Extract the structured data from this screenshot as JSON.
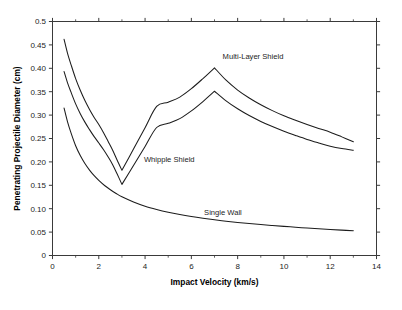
{
  "chart_data": {
    "type": "line",
    "title": "",
    "subtitle": "",
    "xlabel": "Impact Velocity (km/s)",
    "ylabel": "Penetrating Projectile Diameter (cm)",
    "xlim": [
      0,
      14
    ],
    "ylim": [
      0,
      0.5
    ],
    "grid": false,
    "legend_position": "inline-annotations",
    "x_ticks": [
      0,
      2,
      4,
      6,
      8,
      10,
      12,
      14
    ],
    "x_tick_labels": [
      "0",
      "2",
      "4",
      "6",
      "8",
      "10",
      "12",
      "14"
    ],
    "x_minor_ticks": [
      1,
      3,
      5,
      7,
      9,
      11,
      13
    ],
    "y_ticks": [
      0,
      0.05,
      0.1,
      0.15,
      0.2,
      0.25,
      0.3,
      0.35,
      0.4,
      0.45,
      0.5
    ],
    "y_tick_labels": [
      "0",
      "0.05",
      "0.10",
      "0.15",
      "0.20",
      "0.25",
      "0.30",
      "0.35",
      "0.40",
      "0.45",
      "0.5"
    ],
    "series": [
      {
        "name": "Multi-Layer Shield",
        "color": "#1c1c1c",
        "label_x": 7.35,
        "label_y": 0.425,
        "x": [
          0.5,
          0.65,
          0.8,
          1.0,
          1.2,
          1.4,
          1.6,
          1.8,
          2.0,
          2.2,
          2.4,
          2.6,
          2.8,
          3.0,
          3.5,
          4.0,
          4.5,
          5.0,
          5.5,
          6.0,
          6.5,
          7.0,
          7.5,
          8.0,
          8.5,
          9.0,
          9.5,
          10.0,
          10.5,
          11.0,
          11.5,
          12.0,
          12.5,
          13.0
        ],
        "y": [
          0.462,
          0.432,
          0.408,
          0.378,
          0.353,
          0.331,
          0.312,
          0.295,
          0.28,
          0.263,
          0.244,
          0.225,
          0.203,
          0.182,
          0.2275,
          0.273,
          0.3185,
          0.3275,
          0.3385,
          0.3565,
          0.378,
          0.401,
          0.3745,
          0.3535,
          0.3365,
          0.322,
          0.3095,
          0.2985,
          0.289,
          0.28,
          0.2715,
          0.2635,
          0.2535,
          0.243
        ]
      },
      {
        "name": "Whipple Shield",
        "color": "#1c1c1c",
        "label_x": 3.95,
        "label_y": 0.205,
        "x": [
          0.5,
          0.65,
          0.8,
          1.0,
          1.2,
          1.4,
          1.6,
          1.8,
          2.0,
          2.2,
          2.4,
          2.6,
          2.8,
          3.0,
          3.5,
          4.0,
          4.5,
          5.0,
          5.5,
          6.0,
          6.5,
          7.0,
          7.5,
          8.0,
          8.5,
          9.0,
          9.5,
          10.0,
          10.5,
          11.0,
          11.5,
          12.0,
          12.5,
          13.0
        ],
        "y": [
          0.393,
          0.369,
          0.349,
          0.324,
          0.303,
          0.285,
          0.269,
          0.254,
          0.2405,
          0.2265,
          0.211,
          0.194,
          0.1735,
          0.152,
          0.1925,
          0.233,
          0.2735,
          0.2825,
          0.2925,
          0.309,
          0.329,
          0.351,
          0.3305,
          0.3135,
          0.299,
          0.2865,
          0.2755,
          0.2655,
          0.2565,
          0.248,
          0.2405,
          0.2335,
          0.2285,
          0.225
        ]
      },
      {
        "name": "Single Wall",
        "color": "#1c1c1c",
        "label_x": 6.55,
        "label_y": 0.0915,
        "x": [
          0.5,
          0.65,
          0.8,
          1.0,
          1.2,
          1.4,
          1.6,
          1.8,
          2.0,
          2.25,
          2.5,
          2.75,
          3.0,
          3.5,
          4.0,
          4.5,
          5.0,
          5.5,
          6.0,
          6.5,
          7.0,
          7.5,
          8.0,
          8.5,
          9.0,
          9.5,
          10.0,
          10.5,
          11.0,
          11.5,
          12.0,
          12.5,
          13.0
        ],
        "y": [
          0.315,
          0.2855,
          0.262,
          0.2345,
          0.2135,
          0.1965,
          0.1825,
          0.1705,
          0.1605,
          0.1495,
          0.1405,
          0.1325,
          0.1255,
          0.1145,
          0.1055,
          0.0985,
          0.0925,
          0.0875,
          0.0832,
          0.0795,
          0.0762,
          0.0733,
          0.0707,
          0.0683,
          0.0661,
          0.0641,
          0.0622,
          0.0604,
          0.0587,
          0.0571,
          0.0556,
          0.0542,
          0.0528
        ]
      }
    ]
  },
  "annotations": {
    "multi_layer": "Multi-Layer Shield",
    "whipple": "Whipple Shield",
    "single_wall": "Single Wall"
  }
}
